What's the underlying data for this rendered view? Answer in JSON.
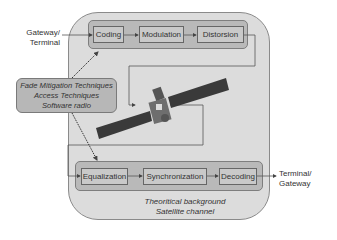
{
  "diagram": {
    "background_caption": {
      "line1": "Theoritical background",
      "line2": "Satellite channel"
    },
    "input_label": {
      "line1": "Gateway/",
      "line2": "Terminal"
    },
    "output_label": {
      "line1": "Terminal/",
      "line2": "Gateway"
    },
    "transmit_chain": [
      {
        "label": "Coding"
      },
      {
        "label": "Modulation"
      },
      {
        "label": "Distorsion"
      }
    ],
    "receive_chain": [
      {
        "label": "Equalization"
      },
      {
        "label": "Synchronization"
      },
      {
        "label": "Decoding"
      }
    ],
    "techniques_box": {
      "line1": "Fade Mitigation Techniques",
      "line2": "Access Techniques",
      "line3": "Software radio"
    },
    "center_image": "satellite-icon",
    "colors": {
      "outer_panel": "#dcdcdc",
      "strip": "#b9b9b9",
      "block": "#c9c9c9",
      "line": "#555555"
    }
  }
}
